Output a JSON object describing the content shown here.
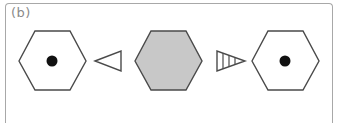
{
  "panel": {
    "label": "(b)"
  },
  "colors": {
    "stroke": "#4a4a4a",
    "gray_fill": "#c8c8c8",
    "dot": "#111111",
    "border": "#a8a8a8",
    "label": "#8a8a8a"
  },
  "figure": {
    "elements": [
      {
        "type": "hexagon",
        "fill": "white",
        "has_dot": true,
        "position": "left"
      },
      {
        "type": "triangle",
        "direction": "left",
        "style": "outline"
      },
      {
        "type": "hexagon",
        "fill": "gray",
        "has_dot": false,
        "position": "center"
      },
      {
        "type": "triangle",
        "direction": "right",
        "style": "hatched-vertical"
      },
      {
        "type": "hexagon",
        "fill": "white",
        "has_dot": true,
        "position": "right"
      }
    ]
  }
}
